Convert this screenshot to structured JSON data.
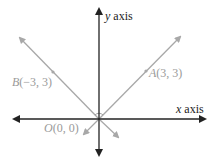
{
  "diagram": {
    "type": "coordinate-plane",
    "axes": {
      "x_label_var": "x",
      "x_label_word": " axis",
      "y_label_var": "y",
      "y_label_word": " axis",
      "color": "#222222"
    },
    "lines": [
      {
        "name": "line-OA",
        "through": [
          "O",
          "A"
        ],
        "color": "#a8a8a8"
      },
      {
        "name": "line-OB",
        "through": [
          "O",
          "B"
        ],
        "color": "#a8a8a8"
      }
    ],
    "points": {
      "A": {
        "name_letter": "A",
        "coords": "(3, 3)"
      },
      "B": {
        "name_letter": "B",
        "coords": "(−3, 3)"
      },
      "O": {
        "name_letter": "O",
        "coords": "(0, 0)"
      }
    },
    "right_angle_marker": "at O between OA and OB"
  }
}
